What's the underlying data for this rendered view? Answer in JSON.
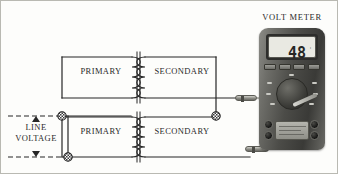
{
  "diagram": {
    "title": "VOLT METER",
    "transformers": {
      "top": {
        "primary_label": "PRIMARY",
        "secondary_label": "SECONDARY"
      },
      "bottom": {
        "primary_label": "PRIMARY",
        "secondary_label": "SECONDARY"
      }
    },
    "source": {
      "label_line1": "LINE",
      "label_line2": "VOLTAGE"
    },
    "meter": {
      "display_value": "48",
      "display_superscript": "'",
      "buttons": [
        "btn-1",
        "btn-2",
        "btn-3",
        "btn-4"
      ],
      "jacks": [
        "jack-top-left",
        "jack-top-right",
        "jack-bottom-left",
        "jack-bottom-right"
      ]
    },
    "probes": {
      "top_probe": "probe-upper",
      "bottom_probe": "probe-lower"
    },
    "colors": {
      "background": "#fdfdfb",
      "border": "#b9b9b2",
      "wire": "#262626",
      "text": "#2a2a2a",
      "meter_dark": "#3a3a37",
      "meter_light": "#a9a9a3",
      "screen": "#e9e9e2"
    }
  }
}
